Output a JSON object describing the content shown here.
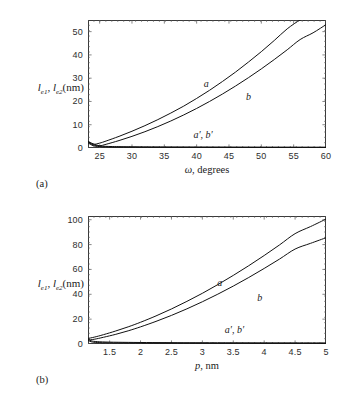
{
  "figure": {
    "panels": [
      {
        "tag": "(a)",
        "ylabel_main": "l",
        "ylabel_sub1": "e1",
        "ylabel_mid": ", l",
        "ylabel_sub2": "e2",
        "ylabel_unit": "(nm)",
        "xlabel_var": "ω",
        "xlabel_unit": ", degrees",
        "curve_labels": [
          {
            "text": "a",
            "x_data": 41.5,
            "y_data": 27.5
          },
          {
            "text": "b",
            "x_data": 48.0,
            "y_data": 22.0
          },
          {
            "text": "a′, b′",
            "x_data": 41.0,
            "y_data": 5.6
          }
        ]
      },
      {
        "tag": "(b)",
        "ylabel_main": "l",
        "ylabel_sub1": "e1",
        "ylabel_mid": ", l",
        "ylabel_sub2": "e2",
        "ylabel_unit": "(nm)",
        "xlabel_var": "p",
        "xlabel_unit": ", nm",
        "curve_labels": [
          {
            "text": "a",
            "x_data": 3.28,
            "y_data": 49.0
          },
          {
            "text": "b",
            "x_data": 3.93,
            "y_data": 37.0
          },
          {
            "text": "a′, b′",
            "x_data": 3.52,
            "y_data": 11.0
          }
        ]
      }
    ]
  },
  "chart_data": [
    {
      "type": "line",
      "panel": "(a)",
      "title": "",
      "xlabel": "ω, degrees",
      "ylabel": "l_e1, l_e2 (nm)",
      "xlim": [
        23.2,
        60
      ],
      "ylim": [
        0,
        55
      ],
      "xticks": [
        25,
        30,
        35,
        40,
        45,
        50,
        55,
        60
      ],
      "yticks": [
        0,
        10,
        20,
        30,
        40,
        50
      ],
      "grid": false,
      "legend": "inline-annotations",
      "series": [
        {
          "name": "a",
          "x": [
            23.2,
            24,
            25,
            26,
            28,
            30,
            32,
            34,
            36,
            38,
            40,
            42,
            44,
            46,
            48,
            50,
            52,
            54,
            56,
            56.6
          ],
          "y": [
            2.8,
            1.6,
            2.1,
            3.0,
            5.0,
            7.2,
            9.6,
            12.2,
            15.0,
            18.0,
            21.3,
            24.8,
            28.6,
            32.6,
            36.9,
            41.4,
            46.2,
            51.2,
            55.0,
            55.0
          ]
        },
        {
          "name": "b",
          "x": [
            23.2,
            24,
            25,
            26,
            28,
            30,
            32,
            34,
            36,
            38,
            40,
            42,
            44,
            46,
            48,
            50,
            52,
            54,
            56,
            58,
            60
          ],
          "y": [
            2.9,
            1.8,
            1.0,
            1.6,
            3.2,
            5.0,
            7.0,
            9.2,
            11.6,
            14.2,
            17.0,
            20.0,
            23.2,
            26.6,
            30.2,
            34.0,
            38.0,
            42.2,
            46.6,
            49.5,
            53.0
          ]
        },
        {
          "name": "a′",
          "x": [
            23.2,
            24,
            25,
            27,
            30,
            35,
            40,
            45,
            50,
            55,
            60
          ],
          "y": [
            2.6,
            1.3,
            0.85,
            0.62,
            0.52,
            0.45,
            0.42,
            0.4,
            0.38,
            0.37,
            0.36
          ]
        },
        {
          "name": "b′",
          "x": [
            23.2,
            24,
            25,
            27,
            30,
            35,
            40,
            45,
            50,
            55,
            60
          ],
          "y": [
            2.2,
            1.0,
            0.6,
            0.42,
            0.34,
            0.28,
            0.25,
            0.23,
            0.22,
            0.21,
            0.2
          ]
        }
      ]
    },
    {
      "type": "line",
      "panel": "(b)",
      "title": "",
      "xlabel": "p, nm",
      "ylabel": "l_e1, l_e2 (nm)",
      "xlim": [
        1.15,
        5.0
      ],
      "ylim": [
        0,
        103
      ],
      "xticks": [
        1.5,
        2,
        2.5,
        3,
        3.5,
        4,
        4.5,
        5
      ],
      "yticks": [
        0,
        20,
        40,
        60,
        80,
        100
      ],
      "grid": false,
      "legend": "inline-annotations",
      "series": [
        {
          "name": "a",
          "x": [
            1.15,
            1.25,
            1.4,
            1.6,
            1.8,
            2.0,
            2.25,
            2.5,
            2.75,
            3.0,
            3.25,
            3.5,
            3.75,
            4.0,
            4.25,
            4.5,
            4.75,
            5.0
          ],
          "y": [
            4.5,
            5.5,
            7.5,
            10.5,
            13.8,
            17.5,
            22.6,
            28.2,
            34.3,
            40.8,
            47.8,
            55.2,
            63.0,
            71.2,
            79.8,
            88.8,
            94.5,
            100.5
          ]
        },
        {
          "name": "b",
          "x": [
            1.15,
            1.25,
            1.4,
            1.6,
            1.8,
            2.0,
            2.25,
            2.5,
            2.75,
            3.0,
            3.25,
            3.5,
            3.75,
            4.0,
            4.25,
            4.5,
            4.75,
            5.0
          ],
          "y": [
            3.2,
            3.8,
            5.4,
            7.8,
            10.6,
            13.8,
            18.2,
            23.0,
            28.3,
            34.0,
            40.1,
            46.6,
            53.5,
            60.8,
            68.4,
            76.4,
            81.0,
            85.5
          ]
        },
        {
          "name": "a′",
          "x": [
            1.15,
            1.2,
            1.3,
            1.5,
            1.8,
            2.2,
            2.6,
            3.0,
            3.5,
            4.0,
            4.5,
            5.0
          ],
          "y": [
            4.2,
            2.6,
            1.9,
            1.5,
            1.3,
            1.15,
            1.05,
            1.0,
            0.95,
            0.9,
            0.88,
            0.85
          ]
        },
        {
          "name": "b′",
          "x": [
            1.15,
            1.2,
            1.3,
            1.5,
            1.8,
            2.2,
            2.6,
            3.0,
            3.5,
            4.0,
            4.5,
            5.0
          ],
          "y": [
            3.0,
            1.8,
            1.2,
            0.95,
            0.8,
            0.7,
            0.65,
            0.62,
            0.58,
            0.55,
            0.53,
            0.5
          ]
        }
      ]
    }
  ]
}
